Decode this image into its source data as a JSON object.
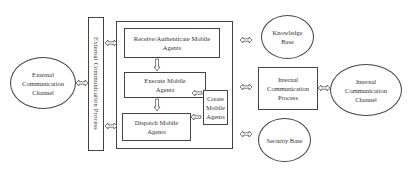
{
  "diagram": {
    "external_channel": {
      "label": "External Communication Channel"
    },
    "external_process": {
      "label": "External Communication Process"
    },
    "mobile_agent_platform": {
      "receive": {
        "label": "Receive/Authenticate Mobile Agents"
      },
      "execute": {
        "label": "Execute Mobile Agents"
      },
      "dispatch": {
        "label": "Dispatch Mobile Agents"
      },
      "create": {
        "label": "Create Mobile Agents"
      }
    },
    "knowledge_base": {
      "label": "Knowledge Base"
    },
    "internal_process": {
      "label": "Internal Communication Process"
    },
    "internal_channel": {
      "label": "Internal Communication Channel"
    },
    "security_base": {
      "label": "Security Base"
    }
  }
}
